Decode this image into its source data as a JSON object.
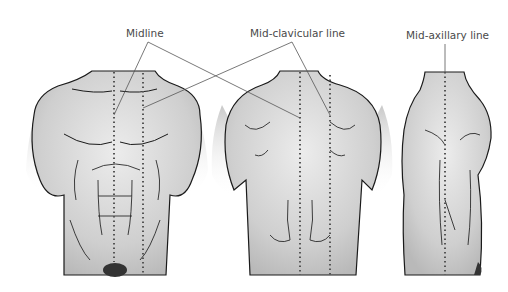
{
  "diagram": {
    "views": [
      {
        "name": "front",
        "description": "anterior torso view"
      },
      {
        "name": "back",
        "description": "posterior torso view"
      },
      {
        "name": "side",
        "description": "lateral torso view"
      }
    ],
    "labels": {
      "midline": "Midline",
      "mid_clavicular": "Mid-clavicular line",
      "mid_axillary": "Mid-axillary line"
    },
    "colors": {
      "skin": "#d4d4d4",
      "outline": "#1a1a1a",
      "dotted_line": "#555555",
      "leader_line": "#555555",
      "label_text": "#4a4a4a"
    }
  }
}
